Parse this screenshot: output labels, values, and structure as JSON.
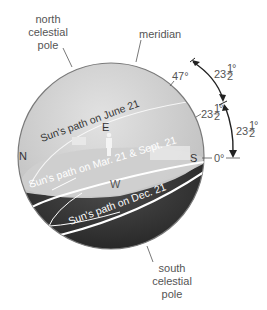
{
  "diagram": {
    "labels": {
      "north_celestial_pole": [
        "north",
        "celestial",
        "pole"
      ],
      "south_celestial_pole": [
        "south",
        "celestial",
        "pole"
      ],
      "meridian": "meridian"
    },
    "directions": {
      "north": "N",
      "south": "S",
      "east": "E",
      "west": "W"
    },
    "sun_paths": {
      "june": "Sun's path on June 21",
      "equinox": "Sun's path on Mar. 21 & Sept. 21",
      "december": "Sun's path on Dec. 21"
    },
    "angles": {
      "summer_altitude": "47°",
      "equinox_altitude_whole": "23",
      "half_num": "1",
      "half_den": "2",
      "degree": "°",
      "horizon": "0°"
    },
    "colors": {
      "sky": "#d4d4d4",
      "ground": "#2e2e2e",
      "horizon_plane": "#c8c8c8",
      "path_line": "#ffffff",
      "label_text": "#555555"
    }
  }
}
